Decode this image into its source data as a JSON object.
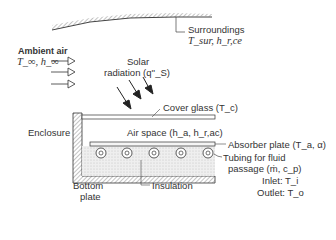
{
  "diagram": {
    "labels": {
      "surroundings": "Surroundings",
      "surroundings_vars": "T_sur, h_r,ce",
      "ambient_air": "Ambient air",
      "ambient_vars": "T_∞, h_∞",
      "solar_line1": "Solar",
      "solar_line2": "radiation (q''_S)",
      "cover_glass": "Cover glass (T_c)",
      "enclosure": "Enclosure",
      "air_space": "Air space (h_a, h_r,ac)",
      "absorber_plate": "Absorber plate (T_a, α)",
      "tubing_line1": "Tubing for fluid",
      "tubing_line2": "passage (ṁ, c_p)",
      "inlet": "Inlet: T_i",
      "outlet": "Outlet: T_o",
      "bottom_plate_line1": "Bottom",
      "bottom_plate_line2": "plate",
      "insulation": "Insulation"
    },
    "tube_count": 5,
    "colors": {
      "line": "#333333",
      "hatch": "#999999",
      "fill": "#e6e6e6"
    }
  }
}
